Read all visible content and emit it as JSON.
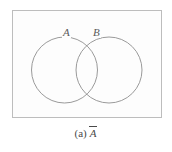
{
  "figure": {
    "kind": "venn-diagram",
    "universe_label": "",
    "sets": [
      {
        "id": "A",
        "label": "A"
      },
      {
        "id": "B",
        "label": "B"
      }
    ],
    "caption": {
      "index": "(a)",
      "expression": "A",
      "overline": true,
      "full": "(a) Ā"
    }
  },
  "geometry": {
    "rect": {
      "x": 12,
      "y": 10,
      "width": 150,
      "height": 108
    },
    "circle_a": {
      "cx": 64.5,
      "cy": 70,
      "r": 33
    },
    "circle_b": {
      "cx": 109,
      "cy": 70,
      "r": 33
    },
    "label_a": {
      "x": 66,
      "y": 32
    },
    "label_b": {
      "x": 97,
      "y": 32
    }
  },
  "colors": {
    "background": "#ffffff",
    "rect_fill": "#fdfdfd",
    "rect_stroke": "#bdbdbd",
    "circle_stroke": "#8f8f8f",
    "label_text": "#5a5a5a",
    "caption_text": "#4a4a4a"
  }
}
